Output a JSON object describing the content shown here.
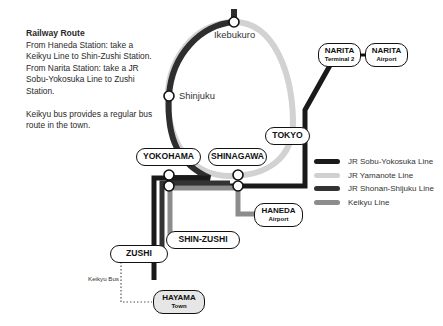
{
  "intro": {
    "title": "Railway Route",
    "lines": [
      "From Haneda Station: take a Keikyu Line to Shin-Zushi Station.",
      "From Narita Station: take a JR Sobu-Yokosuka Line to Zushi Station."
    ],
    "bus_note": "Keikyu bus provides a regular bus route in the town."
  },
  "stations": {
    "ikebukuro": "Ikebukuro",
    "shinjuku": "Shinjuku",
    "tokyo": "TOKYO",
    "yokohama": "YOKOHAMA",
    "shinagawa": "SHINAGAWA",
    "narita_t2": {
      "name": "NARITA",
      "sub": "Terminal 2"
    },
    "narita_airport": {
      "name": "NARITA",
      "sub": "Airport"
    },
    "haneda": {
      "name": "HANEDA",
      "sub": "Airport"
    },
    "shin_zushi": "SHIN-ZUSHI",
    "zushi": "ZUSHI",
    "hayama": {
      "name": "HAYAMA",
      "sub": "Town"
    }
  },
  "bus_label": "Keikyu Bus",
  "legend": [
    {
      "label": "JR Sobu-Yokosuka Line",
      "color": "#1a1a1a"
    },
    {
      "label": "JR Yamanote Line",
      "color": "#d0d0d0"
    },
    {
      "label": "JR Shonan-Shijuku Line",
      "color": "#333333"
    },
    {
      "label": "Keikyu Line",
      "color": "#8c8c8c"
    }
  ],
  "colors": {
    "sobu_yokosuka": "#1a1a1a",
    "yamanote": "#d0d0d0",
    "shonan_shinjuku": "#333333",
    "keikyu": "#8c8c8c"
  }
}
